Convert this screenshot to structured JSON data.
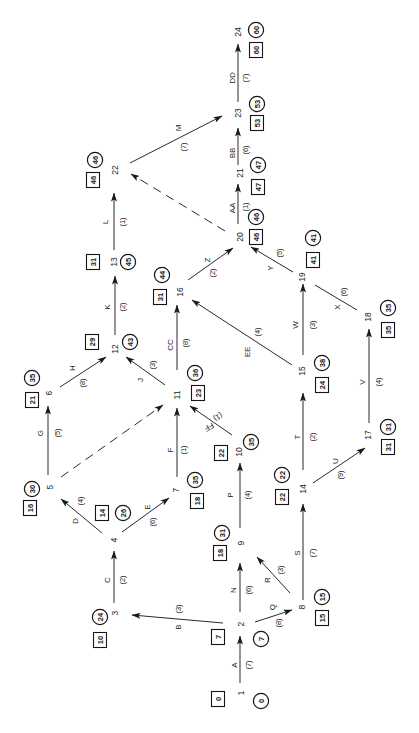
{
  "diagram": {
    "type": "activity-on-arrow network",
    "legend": {
      "box": "earliest event time",
      "circle": "latest event time",
      "dashed_arrow": "dummy activity"
    },
    "nodes": [
      {
        "id": "1",
        "early": "0",
        "late": "0"
      },
      {
        "id": "2",
        "early": "7",
        "late": "7"
      },
      {
        "id": "3",
        "early": "10",
        "late": "24"
      },
      {
        "id": "4",
        "early": "14",
        "late": "26"
      },
      {
        "id": "5",
        "early": "16",
        "late": "30"
      },
      {
        "id": "6",
        "early": "21",
        "late": "35"
      },
      {
        "id": "7",
        "early": "18",
        "late": "35"
      },
      {
        "id": "8",
        "early": "15",
        "late": "15"
      },
      {
        "id": "9",
        "early": "18",
        "late": "31"
      },
      {
        "id": "10",
        "early": "22",
        "late": "35"
      },
      {
        "id": "11",
        "early": "23",
        "late": "36"
      },
      {
        "id": "12",
        "early": "29",
        "late": "43"
      },
      {
        "id": "13",
        "early": "31",
        "late": "45"
      },
      {
        "id": "14",
        "early": "22",
        "late": "22"
      },
      {
        "id": "15",
        "early": "24",
        "late": "38"
      },
      {
        "id": "16",
        "early": "31",
        "late": "44"
      },
      {
        "id": "17",
        "early": "31",
        "late": "31"
      },
      {
        "id": "18",
        "early": "35",
        "late": "35"
      },
      {
        "id": "19",
        "early": "41",
        "late": "41"
      },
      {
        "id": "20",
        "early": "46",
        "late": "46"
      },
      {
        "id": "21",
        "early": "47",
        "late": "47"
      },
      {
        "id": "22",
        "early": "46",
        "late": "46"
      },
      {
        "id": "23",
        "early": "53",
        "late": "53"
      },
      {
        "id": "24",
        "early": "60",
        "late": "60"
      }
    ],
    "edges": [
      {
        "key": "A",
        "activity": "A",
        "duration": "(7)",
        "from": "1",
        "to": "2"
      },
      {
        "key": "B",
        "activity": "B",
        "duration": "(3)",
        "from": "2",
        "to": "3"
      },
      {
        "key": "C",
        "activity": "C",
        "duration": "(2)",
        "from": "3",
        "to": "4"
      },
      {
        "key": "D",
        "activity": "D",
        "duration": "(4)",
        "from": "4",
        "to": "5"
      },
      {
        "key": "E",
        "activity": "E",
        "duration": "(6)",
        "from": "4",
        "to": "7"
      },
      {
        "key": "F",
        "activity": "F",
        "duration": "(1)",
        "from": "7",
        "to": "11"
      },
      {
        "key": "G",
        "activity": "G",
        "duration": "(5)",
        "from": "5",
        "to": "6"
      },
      {
        "key": "H",
        "activity": "H",
        "duration": "(8)",
        "from": "6",
        "to": "12"
      },
      {
        "key": "J",
        "activity": "J",
        "duration": "(3)",
        "from": "11",
        "to": "12"
      },
      {
        "key": "K",
        "activity": "K",
        "duration": "(2)",
        "from": "12",
        "to": "13"
      },
      {
        "key": "L",
        "activity": "L",
        "duration": "(1)",
        "from": "13",
        "to": "22"
      },
      {
        "key": "M",
        "activity": "M",
        "duration": "(7)",
        "from": "22",
        "to": "23"
      },
      {
        "key": "N",
        "activity": "N",
        "duration": "(6)",
        "from": "2",
        "to": "9"
      },
      {
        "key": "P",
        "activity": "P",
        "duration": "(4)",
        "from": "9",
        "to": "10"
      },
      {
        "key": "Q",
        "activity": "Q",
        "duration": "(8)",
        "from": "2",
        "to": "8"
      },
      {
        "key": "R",
        "activity": "R",
        "duration": "(3)",
        "from": "8",
        "to": "9"
      },
      {
        "key": "S",
        "activity": "S",
        "duration": "(7)",
        "from": "8",
        "to": "14"
      },
      {
        "key": "T",
        "activity": "T",
        "duration": "(2)",
        "from": "14",
        "to": "15"
      },
      {
        "key": "U",
        "activity": "U",
        "duration": "(9)",
        "from": "14",
        "to": "17"
      },
      {
        "key": "V",
        "activity": "V",
        "duration": "(4)",
        "from": "17",
        "to": "18"
      },
      {
        "key": "W",
        "activity": "W",
        "duration": "(3)",
        "from": "15",
        "to": "19"
      },
      {
        "key": "X",
        "activity": "X",
        "duration": "(6)",
        "from": "18",
        "to": "19"
      },
      {
        "key": "Y",
        "activity": "Y",
        "duration": "(5)",
        "from": "19",
        "to": "20"
      },
      {
        "key": "Z",
        "activity": "Z",
        "duration": "(2)",
        "from": "16",
        "to": "20"
      },
      {
        "key": "AA",
        "activity": "AA",
        "duration": "(1)",
        "from": "20",
        "to": "21"
      },
      {
        "key": "BB",
        "activity": "BB",
        "duration": "(6)",
        "from": "21",
        "to": "23"
      },
      {
        "key": "CC",
        "activity": "CC",
        "duration": "(8)",
        "from": "11",
        "to": "16"
      },
      {
        "key": "DD",
        "activity": "DD",
        "duration": "(7)",
        "from": "23",
        "to": "24"
      },
      {
        "key": "EE",
        "activity": "EE",
        "duration": "(4)",
        "from": "15",
        "to": "16"
      },
      {
        "key": "FF",
        "activity": "FF",
        "duration": "(1)",
        "from": "10",
        "to": "11"
      },
      {
        "key": "d5-11",
        "dummy": true,
        "from": "5",
        "to": "11"
      },
      {
        "key": "d20-22",
        "dummy": true,
        "from": "20",
        "to": "22"
      }
    ]
  }
}
